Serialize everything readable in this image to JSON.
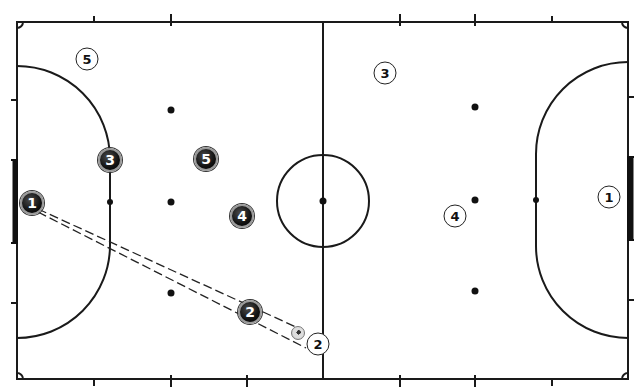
{
  "diagram": {
    "type": "futsal-court-tactical",
    "court": {
      "left": 17,
      "right": 628,
      "top": 22,
      "bottom": 379,
      "midline_x": 323,
      "center": {
        "x": 323,
        "y": 201,
        "r": 46
      },
      "line_color": "#1a1a1a"
    },
    "team_dark": [
      {
        "number": "1",
        "x": 32,
        "y": 203
      },
      {
        "number": "3",
        "x": 110,
        "y": 160
      },
      {
        "number": "5",
        "x": 206,
        "y": 159
      },
      {
        "number": "4",
        "x": 242,
        "y": 216
      },
      {
        "number": "2",
        "x": 250,
        "y": 312
      }
    ],
    "team_light": [
      {
        "number": "5",
        "x": 87,
        "y": 59
      },
      {
        "number": "3",
        "x": 385,
        "y": 73
      },
      {
        "number": "4",
        "x": 455,
        "y": 216
      },
      {
        "number": "1",
        "x": 609,
        "y": 197
      },
      {
        "number": "2",
        "x": 318,
        "y": 344
      }
    ],
    "ball": {
      "x": 298,
      "y": 333
    },
    "pass_lines": [
      {
        "from": "dark-1",
        "to": "light-2",
        "style": "dashed-double"
      }
    ]
  }
}
